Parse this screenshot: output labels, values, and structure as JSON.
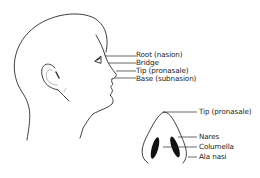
{
  "diagram": {
    "profile_view": {
      "labels": [
        {
          "id": "root",
          "text": "Root (nasion)"
        },
        {
          "id": "bridge",
          "text": "Bridge"
        },
        {
          "id": "tip",
          "text": "Tip (pronasale)"
        },
        {
          "id": "base",
          "text": "Base (subnasion)"
        }
      ]
    },
    "basal_view": {
      "labels": [
        {
          "id": "tip",
          "text": "Tip (pronasale)"
        },
        {
          "id": "nares",
          "text": "Nares"
        },
        {
          "id": "columella",
          "text": "Columella"
        },
        {
          "id": "ala",
          "text": "Ala nasi"
        }
      ]
    },
    "colors": {
      "line": "#2a2a2a",
      "text": "#222222",
      "background": "#ffffff"
    }
  }
}
